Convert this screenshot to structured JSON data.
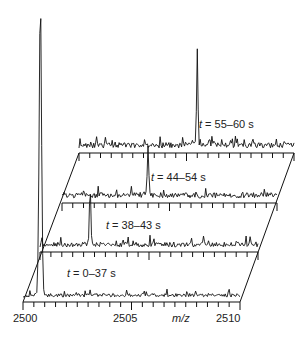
{
  "chart_data": {
    "type": "line",
    "title": "",
    "xlabel": "m/z",
    "ylabel": "",
    "xlim": [
      2500,
      2510
    ],
    "x_ticks": [
      "2500",
      "2505",
      "2510"
    ],
    "grid": false,
    "legend": "none",
    "layout": "stacked 3D waterfall of mass spectra, oblique perspective",
    "series": [
      {
        "name": "t = 55–60 s",
        "peak_mz": 2505.5,
        "peak_relative_height": 0.55,
        "noise": "high"
      },
      {
        "name": "t = 44–54 s",
        "peak_mz": 2504.0,
        "peak_relative_height": 0.28,
        "noise": "high"
      },
      {
        "name": "t = 38–43 s",
        "peak_mz": 2502.3,
        "peak_relative_height": 0.35,
        "noise": "medium"
      },
      {
        "name": "t = 0–37 s",
        "peak_mz": 2500.8,
        "peak_relative_height": 1.0,
        "noise": "low"
      }
    ]
  },
  "labels": {
    "trace1": {
      "prefix": "t",
      "suffix": " = 55–60 s"
    },
    "trace2": {
      "prefix": "t",
      "suffix": " = 44–54 s"
    },
    "trace3": {
      "prefix": "t",
      "suffix": " = 38–43 s"
    },
    "trace4": {
      "prefix": "t",
      "suffix": " = 0–37 s"
    }
  },
  "axis": {
    "tick_2500": "2500",
    "tick_2505": "2505",
    "tick_2510": "2510",
    "xlabel": "m/z"
  }
}
